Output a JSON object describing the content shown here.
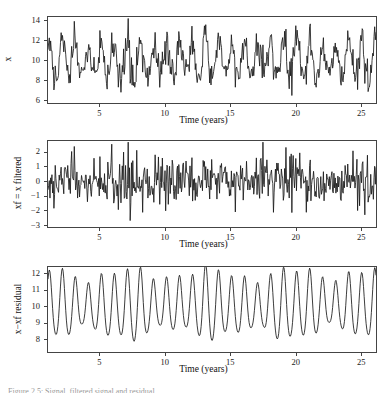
{
  "figure": {
    "width": 391,
    "height": 389,
    "background": "#ffffff",
    "line_color": "#1a1a1a",
    "frame_color": "#444444",
    "caption_partial": "Figure 2.5: Signal, filtered signal and residual."
  },
  "chart_data": [
    {
      "type": "line",
      "panel_index": 0,
      "title": "",
      "xlabel": "Time (years)",
      "ylabel": "x",
      "xlim": [
        1.0,
        26.2
      ],
      "ylim": [
        5.6,
        14.45
      ],
      "xticks": [
        5,
        10,
        15,
        20,
        25
      ],
      "yticks": [
        6,
        8,
        10,
        12,
        14
      ],
      "xtick_labels": [
        "5",
        "10",
        "15",
        "20",
        "25"
      ],
      "ytick_labels": [
        "6",
        "8",
        "10",
        "12",
        "14"
      ],
      "grid": false,
      "legend": "none",
      "series": [
        {
          "name": "x",
          "x_start": 1.05,
          "x_step": 0.0595,
          "values": [
            8.55,
            10.2,
            12.35,
            11.55,
            11.0,
            11.85,
            11.3,
            9.6,
            8.5,
            7.3,
            7.15,
            8.6,
            9.3,
            10.2,
            11.1,
            10.4,
            9.5,
            9.1,
            9.4,
            10.5,
            11.6,
            12.2,
            12.35,
            11.4,
            10.2,
            9.1,
            8.2,
            7.5,
            7.2,
            7.6,
            8.6,
            9.5,
            9.2,
            8.8,
            9.6,
            10.6,
            11.3,
            11.9,
            11.5,
            10.6,
            10.9,
            11.5,
            10.8,
            9.9,
            9.1,
            8.3,
            8.0,
            8.5,
            9.2,
            9.9,
            9.6,
            9.3,
            9.9,
            10.2,
            9.7,
            9.1,
            9.6,
            10.8,
            11.9,
            12.3,
            11.7,
            10.9,
            10.2,
            9.3,
            8.4,
            7.6,
            7.3,
            7.9,
            8.9,
            9.6,
            10.0,
            9.7,
            9.4,
            10.0,
            11.0,
            11.6,
            12.0,
            11.3,
            10.5,
            9.9,
            10.2,
            10.8,
            10.5,
            9.8,
            9.1,
            8.4,
            7.9,
            7.5,
            7.6,
            8.3,
            9.3,
            10.4,
            11.3,
            11.7,
            11.1,
            10.4,
            10.8,
            11.5,
            11.0,
            10.2,
            9.4,
            8.5,
            7.8,
            6.3,
            7.2,
            8.4,
            9.3,
            9.9,
            9.5,
            9.0,
            9.5,
            10.4,
            11.2,
            11.8,
            12.4,
            11.9,
            11.1,
            10.3,
            9.5,
            8.8,
            8.2,
            8.6,
            9.4,
            9.9,
            9.5,
            9.0,
            9.4,
            10.1,
            10.6,
            11.3,
            12.1,
            11.6,
            10.8,
            10.1,
            9.3,
            8.5,
            8.1,
            8.4,
            9.3,
            10.2,
            10.9,
            11.2,
            10.6,
            10.0,
            10.5,
            11.4,
            12.4,
            13.8,
            13.0,
            12.2,
            11.4,
            10.6,
            9.8,
            9.2,
            8.6,
            8.9,
            9.7,
            10.4,
            10.0,
            9.5,
            9.9,
            10.7,
            11.2,
            10.6,
            9.9,
            9.2,
            8.4,
            7.7,
            7.2,
            6.1,
            7.0,
            8.2,
            9.2,
            10.0,
            10.5,
            10.1,
            9.6,
            10.1,
            11.0,
            11.8,
            12.4,
            11.8,
            11.0,
            10.3,
            9.6,
            8.9,
            8.3,
            8.7,
            9.5,
            10.1,
            9.7,
            9.3,
            9.8,
            10.6,
            11.4,
            12.1,
            11.5,
            10.7,
            10.0,
            9.2,
            8.5,
            8.0,
            8.3,
            9.1,
            9.9,
            10.6,
            10.2,
            9.7,
            10.2,
            11.0,
            11.7,
            12.2,
            11.6,
            10.8,
            10.1,
            9.4,
            8.7,
            8.1,
            8.5,
            9.3,
            10.0,
            9.6,
            9.2,
            9.7,
            10.5,
            11.3,
            12.0,
            12.9,
            12.2,
            11.4,
            10.6,
            9.8,
            9.0,
            8.4,
            8.8,
            9.6,
            10.3,
            9.9,
            9.4,
            9.9,
            10.8,
            11.6,
            12.3,
            11.7,
            10.9,
            10.2,
            9.4,
            8.6,
            7.9,
            7.4,
            7.8,
            8.7,
            9.6,
            10.3,
            10.8,
            10.4,
            9.9,
            10.4,
            11.3,
            12.1,
            13.5,
            12.6,
            11.8,
            11.0,
            10.2,
            9.5,
            8.8,
            8.2,
            8.6,
            9.4,
            10.1,
            9.7,
            9.3,
            9.8,
            10.6,
            11.4,
            12.2,
            11.6,
            10.8,
            10.1,
            9.3,
            8.6,
            8.0,
            8.4,
            9.2,
            9.9,
            10.6,
            11.2,
            11.6,
            11.0,
            10.3,
            9.6,
            8.9,
            8.3,
            8.7,
            9.5,
            10.2,
            10.8,
            11.5,
            12.2,
            13.0,
            14.1,
            13.2,
            12.4,
            11.6,
            10.8,
            10.0,
            9.3,
            8.7,
            9.1,
            9.9,
            10.5,
            10.1,
            9.6,
            10.1,
            10.9,
            11.7,
            12.4,
            11.8,
            11.0,
            10.2,
            9.4,
            8.7,
            8.1,
            8.5,
            9.3,
            10.0,
            10.7,
            11.3,
            12.0,
            12.6,
            11.9,
            11.1,
            10.3,
            9.5,
            8.8,
            8.2,
            8.6,
            9.4,
            10.2,
            10.9,
            11.4,
            10.9,
            10.2,
            9.5,
            8.8,
            8.2,
            7.6,
            6.9,
            6.3,
            7.1,
            8.2,
            9.2,
            10.1,
            10.8,
            11.4,
            12.1,
            12.9,
            14.3,
            13.6,
            12.8,
            12.0,
            11.2,
            10.4,
            9.6,
            8.9,
            8.3,
            8.7,
            9.5,
            10.3,
            11.0,
            11.8,
            12.5,
            13.1,
            12.5,
            11.7,
            10.9,
            10.1,
            9.4,
            8.7,
            8.1,
            7.5,
            7.0,
            6.9,
            7.3,
            8.2,
            9.1,
            10.0,
            10.8,
            11.5,
            12.2,
            11.6,
            10.9,
            10.2,
            9.5,
            8.9,
            8.4,
            8.8,
            9.6,
            10.3,
            11.0,
            11.7,
            12.4,
            11.8,
            11.1,
            10.4,
            9.7,
            9.0,
            8.4,
            7.8,
            7.3,
            6.8,
            7.4,
            8.4,
            9.3,
            10.1,
            10.8,
            11.4,
            12.0,
            12.7,
            13.4,
            12.7,
            11.9,
            11.1,
            10.3,
            9.6,
            8.9,
            8.3,
            8.7,
            9.5,
            10.2,
            10.9,
            11.5,
            10.9,
            10.3,
            9.7,
            9.1,
            8.6,
            9.0,
            9.8,
            10.5,
            11.2,
            11.9,
            12.5,
            11.9,
            11.2,
            10.5,
            9.8,
            9.2,
            8.7,
            9.1,
            9.9,
            10.6,
            11.3,
            12.0,
            12.8,
            13.6,
            12.9,
            12.1,
            11.3,
            10.5,
            9.8,
            9.1,
            8.5,
            8.0,
            7.5,
            8.0,
            8.9,
            9.7,
            10.4,
            11.0,
            11.6,
            12.2,
            11.7,
            11.0,
            10.3,
            9.7,
            9.1,
            8.6,
            9.0,
            9.8,
            10.5,
            11.2,
            11.8,
            11.2,
            10.6,
            10.0,
            9.4,
            8.9,
            9.3,
            10.0,
            10.7,
            11.3,
            11.9,
            11.4,
            10.7,
            10.1,
            9.5,
            9.0,
            8.5,
            8.9,
            9.7,
            10.4,
            11.1,
            11.7,
            12.3,
            11.7,
            11.0,
            10.4,
            9.8,
            9.2,
            8.7,
            9.1,
            9.9,
            10.6,
            11.2,
            10.7,
            10.1,
            9.6,
            9.1,
            9.6,
            10.3,
            11.0,
            11.6,
            11.1,
            10.5,
            9.9,
            9.4,
            9.8,
            10.4,
            9.9,
            9.4,
            9.0,
            9.4,
            10.0,
            9.5,
            9.1,
            8.8,
            9.2,
            9.8,
            9.4,
            9.0,
            9.3
          ]
        }
      ]
    },
    {
      "type": "line",
      "panel_index": 1,
      "title": "",
      "xlabel": "Time (years)",
      "ylabel": "xf = x filtered",
      "xlim": [
        1.0,
        26.2
      ],
      "ylim": [
        -3.2,
        2.8
      ],
      "xticks": [
        5,
        10,
        15,
        20,
        25
      ],
      "yticks": [
        -3,
        -2,
        -1,
        0,
        1,
        2
      ],
      "xtick_labels": [
        "−3",
        "−2",
        "−1",
        "0",
        "1",
        "2"
      ],
      "ytick_labels": [
        "2",
        "1",
        "0",
        "−1",
        "−2",
        "−3"
      ],
      "grid": false,
      "legend": "none",
      "noise_amplitude": 1.0,
      "description": "High-frequency residual noise, roughly zero mean, range -3 to 2.7"
    },
    {
      "type": "line",
      "panel_index": 2,
      "title": "",
      "xlabel": "Time (years)",
      "ylabel": "x−xf residual",
      "xlim": [
        1.0,
        26.2
      ],
      "ylim": [
        7.15,
        12.45
      ],
      "xticks": [
        5,
        10,
        15,
        20,
        25
      ],
      "yticks": [
        8,
        9,
        10,
        11,
        12
      ],
      "xtick_labels": [
        "5",
        "10",
        "15",
        "20",
        "25"
      ],
      "ytick_labels": [
        "12",
        "11",
        "10",
        "9",
        "8"
      ],
      "grid": false,
      "legend": "none",
      "description": "Smooth annual oscillation around 10, amplitude ~2"
    }
  ]
}
